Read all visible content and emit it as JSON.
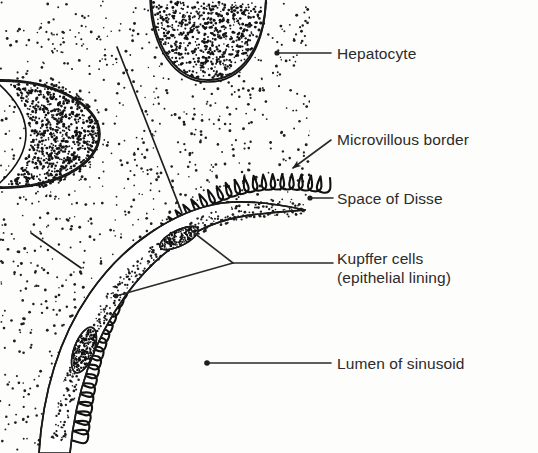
{
  "figure": {
    "background_color": "#fdfdfc",
    "ink_color": "#1a1a1a",
    "width": 538,
    "height": 453
  },
  "labels": [
    {
      "id": "hepatocyte",
      "text": "Hepatocyte",
      "x": 337,
      "y": 44,
      "leader": {
        "type": "line",
        "x1": 277,
        "y1": 53,
        "x2": 331,
        "y2": 53,
        "dot_at": "start"
      }
    },
    {
      "id": "microvillous-border",
      "text": "Microvillous border",
      "x": 337,
      "y": 130,
      "leader": {
        "type": "arrow",
        "x1": 331,
        "y1": 140,
        "x2": 289,
        "y2": 171
      }
    },
    {
      "id": "space-of-disse",
      "text": "Space of Disse",
      "x": 337,
      "y": 189,
      "leader": {
        "type": "line",
        "x1": 310,
        "y1": 198,
        "x2": 333,
        "y2": 198,
        "dot_at": "start"
      }
    },
    {
      "id": "kupffer-cells",
      "text": "Kupffer cells",
      "text_line2": "(epithelial lining)",
      "x": 337,
      "y": 249,
      "leader": {
        "type": "fork",
        "x_text": 333,
        "y_text": 263,
        "fork_x": 233,
        "fork_y": 263,
        "branch1_x": 193,
        "branch1_y": 232,
        "branch2_x": 115,
        "branch2_y": 296
      }
    },
    {
      "id": "lumen-of-sinusoid",
      "text": "Lumen of sinusoid",
      "x": 337,
      "y": 354,
      "leader": {
        "type": "line",
        "x1": 207,
        "y1": 363,
        "x2": 331,
        "y2": 363,
        "dot_at": "start"
      }
    }
  ],
  "structures": [
    {
      "id": "hepatocyte-cytoplasm",
      "name": "stippled hepatocyte cytoplasm"
    },
    {
      "id": "hepatocyte-nucleus-top",
      "name": "hepatocyte nucleus (upper, partial)"
    },
    {
      "id": "hepatocyte-nucleus-left",
      "name": "hepatocyte nucleus (left, partial)"
    },
    {
      "id": "microvilli-membrane",
      "name": "microvillous border membrane"
    },
    {
      "id": "space-of-disse-gap",
      "name": "space of Disse"
    },
    {
      "id": "endothelial-lining",
      "name": "endothelial / Kupffer cell lining"
    },
    {
      "id": "kupffer-nucleus-upper",
      "name": "Kupffer cell nucleus (upper)"
    },
    {
      "id": "kupffer-nucleus-lower",
      "name": "Kupffer cell nucleus (lower)"
    },
    {
      "id": "sinusoid-lumen",
      "name": "lumen of sinusoid"
    }
  ],
  "pointer_lines": [
    {
      "id": "nucleus-pointer-upper",
      "x1": 117,
      "y1": 47,
      "x2": 182,
      "y2": 213
    },
    {
      "id": "cytoplasm-pointer-left",
      "x1": 31,
      "y1": 233,
      "x2": 81,
      "y2": 268
    }
  ]
}
